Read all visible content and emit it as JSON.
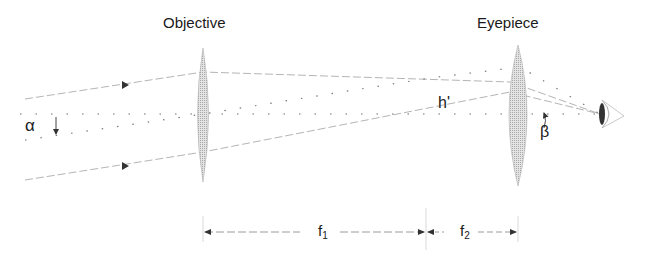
{
  "labels": {
    "objective": "Objective",
    "eyepiece": "Eyepiece",
    "alpha": "α",
    "beta": "β",
    "image_height": "h'",
    "f1_main": "f",
    "f1_sub": "1",
    "f2_main": "f",
    "f2_sub": "2"
  },
  "colors": {
    "lens_fill": "#bdbdbd",
    "ray": "#9a9a9a",
    "axis_dots": "#6e6e6e",
    "text": "#1a1a1a"
  }
}
